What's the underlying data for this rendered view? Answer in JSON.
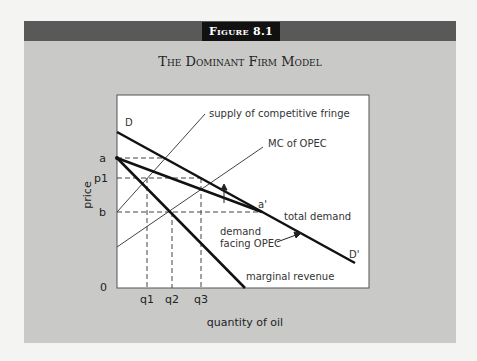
{
  "figure": {
    "number_label": "Figure 8.1",
    "title": "The Dominant Firm Model"
  },
  "axes": {
    "x_label": "quantity of oil",
    "y_label": "price",
    "origin_label": "0",
    "y_ticks": [
      "a",
      "p1",
      "b"
    ],
    "x_ticks": [
      "q1",
      "q2",
      "q3"
    ]
  },
  "curves": {
    "total_demand_start": "D",
    "total_demand_end": "D'",
    "total_demand_label": "total demand",
    "supply_label": "supply of competitive fringe",
    "mc_label": "MC of OPEC",
    "demand_opec_label_line1": "demand",
    "demand_opec_label_line2": "facing OPEC",
    "mr_label": "marginal revenue",
    "kink_point_label": "a'"
  },
  "colors": {
    "page_bg": "#f4f4f2",
    "panel_bg": "#c9c9c7",
    "header_bar": "#595959",
    "figure_tab": "#111111",
    "plot_bg": "#ffffff",
    "thick_line": "#111111",
    "thin_line": "#444444"
  }
}
